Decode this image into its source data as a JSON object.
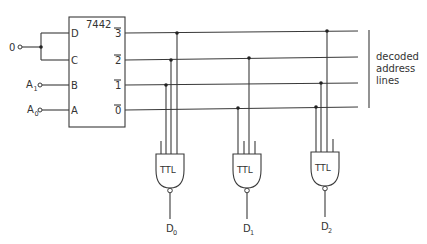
{
  "chip": {
    "part_number": "7442",
    "inputs": [
      {
        "pin": "D",
        "y": 33
      },
      {
        "pin": "C",
        "y": 60
      },
      {
        "pin": "B",
        "y": 85
      },
      {
        "pin": "A",
        "y": 110
      }
    ],
    "outputs": [
      {
        "label": "3",
        "overbar": true,
        "y": 33
      },
      {
        "label": "2",
        "overbar": true,
        "y": 60
      },
      {
        "label": "1",
        "overbar": true,
        "y": 85
      },
      {
        "label": "0",
        "overbar": true,
        "y": 110
      }
    ]
  },
  "input_signals": {
    "zero": {
      "label": "0",
      "connects_to": [
        "D",
        "C"
      ]
    },
    "a1": {
      "label": "A",
      "subscript": "1",
      "connects_to": "B"
    },
    "a0": {
      "label": "A",
      "subscript": "0",
      "connects_to": "A"
    }
  },
  "bracket_label": {
    "lines": [
      "decoded",
      "address",
      "lines"
    ]
  },
  "gates": [
    {
      "label": "TTL",
      "output": "D",
      "output_subscript": "0",
      "taps": [
        "1",
        "2",
        "3"
      ]
    },
    {
      "label": "TTL",
      "output": "D",
      "output_subscript": "1",
      "taps": [
        "0",
        "2"
      ]
    },
    {
      "label": "TTL",
      "output": "D",
      "output_subscript": "2",
      "taps": [
        "0",
        "1",
        "3"
      ]
    }
  ],
  "colors": {
    "line": "#3a3a3a",
    "text": "#333333",
    "background": "#ffffff"
  }
}
